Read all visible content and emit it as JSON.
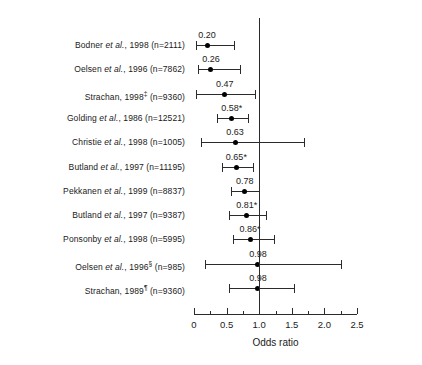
{
  "chart_data": {
    "type": "forest",
    "title": "",
    "xlabel": "Odds ratio",
    "ylabel": "",
    "xlim": [
      0,
      2.5
    ],
    "null_value": 1.0,
    "grid": false,
    "xticks_major": [
      {
        "value": 0,
        "label": "0"
      },
      {
        "value": 0.5,
        "label": "0.5"
      },
      {
        "value": 1.0,
        "label": "1.0"
      },
      {
        "value": 1.5,
        "label": "1.5"
      },
      {
        "value": 2.0,
        "label": "2.0"
      },
      {
        "value": 2.5,
        "label": "2.5"
      }
    ],
    "xticks_minor": [
      0.25,
      0.75,
      1.25,
      1.75,
      2.25
    ],
    "rows": [
      {
        "label_author": "Bodner",
        "label_etal": "et al.",
        "label_year": "1998",
        "label_sup": "",
        "label_n": "(n=2111)",
        "label_full": "Bodner et al., 1998 (n=2111)",
        "value": 0.2,
        "value_label": "0.20",
        "ci_low": 0.03,
        "ci_high": 0.62
      },
      {
        "label_author": "Oelsen",
        "label_etal": "et al.",
        "label_year": "1996",
        "label_sup": "",
        "label_n": "(n=7862)",
        "label_full": "Oelsen et al., 1996 (n=7862)",
        "value": 0.26,
        "value_label": "0.26",
        "ci_low": 0.06,
        "ci_high": 0.71
      },
      {
        "label_author": "Strachan,",
        "label_etal": "",
        "label_year": "1998",
        "label_sup": "‡",
        "label_n": "(n=9360)",
        "label_full": "Strachan, 1998‡ (n=9360)",
        "value": 0.47,
        "value_label": "0.47",
        "ci_low": 0.03,
        "ci_high": 0.94
      },
      {
        "label_author": "Golding",
        "label_etal": "et al.",
        "label_year": "1986",
        "label_sup": "",
        "label_n": "(n=12521)",
        "label_full": "Golding et al., 1986 (n=12521)",
        "value": 0.58,
        "value_label": "0.58*",
        "ci_low": 0.36,
        "ci_high": 0.83
      },
      {
        "label_author": "Christie",
        "label_etal": "et al.",
        "label_year": "1998",
        "label_sup": "",
        "label_n": "(n=1005)",
        "label_full": "Christie et al., 1998 (n=1005)",
        "value": 0.63,
        "value_label": "0.63",
        "ci_low": 0.1,
        "ci_high": 1.68
      },
      {
        "label_author": "Butland",
        "label_etal": "et al.",
        "label_year": "1997",
        "label_sup": "",
        "label_n": "(n=11195)",
        "label_full": "Butland et al., 1997 (n=11195)",
        "value": 0.65,
        "value_label": "0.65*",
        "ci_low": 0.43,
        "ci_high": 0.9
      },
      {
        "label_author": "Pekkanen",
        "label_etal": "et al.",
        "label_year": "1999",
        "label_sup": "",
        "label_n": "(n=8837)",
        "label_full": "Pekkanen et al., 1999 (n=8837)",
        "value": 0.78,
        "value_label": "0.78",
        "ci_low": 0.57,
        "ci_high": 0.99
      },
      {
        "label_author": "Butland",
        "label_etal": "et al.",
        "label_year": "1997",
        "label_sup": "",
        "label_n": "(n=9387)",
        "label_full": "Butland et al., 1997 (n=9387)",
        "value": 0.81,
        "value_label": "0.81*",
        "ci_low": 0.54,
        "ci_high": 1.11
      },
      {
        "label_author": "Ponsonby",
        "label_etal": "et al.",
        "label_year": "1998",
        "label_sup": "",
        "label_n": "(n=5995)",
        "label_full": "Ponsonby et al., 1998 (n=5995)",
        "value": 0.86,
        "value_label": "0.86*",
        "ci_low": 0.6,
        "ci_high": 1.23
      },
      {
        "label_author": "Oelsen",
        "label_etal": "et al.",
        "label_year": "1996",
        "label_sup": "§",
        "label_n": "(n=985)",
        "label_full": "Oelsen et al., 1996§ (n=985)",
        "value": 0.98,
        "value_label": "0.98",
        "ci_low": 0.17,
        "ci_high": 2.25
      },
      {
        "label_author": "Strachan,",
        "label_etal": "",
        "label_year": "1989",
        "label_sup": "¶",
        "label_n": "(n=9360)",
        "label_full": "Strachan, 1989¶ (n=9360)",
        "value": 0.98,
        "value_label": "0.98",
        "ci_low": 0.53,
        "ci_high": 1.53
      }
    ]
  },
  "colors": {
    "line": "#2b2b2b",
    "marker": "#000000",
    "text": "#1a1a1a",
    "background": "#ffffff"
  }
}
